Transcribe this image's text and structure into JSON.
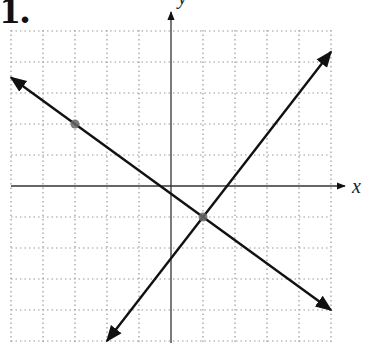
{
  "problem_label": "1.",
  "chart_data": {
    "type": "line",
    "title": "",
    "xlabel": "x",
    "ylabel": "y",
    "xlim": [
      -5,
      5
    ],
    "ylim": [
      -5,
      5
    ],
    "grid": true,
    "grid_style": "dotted",
    "series": [
      {
        "name": "line-1",
        "slope": -0.75,
        "intercept": -0.25,
        "x": [
          -5,
          5
        ],
        "y": [
          3.5,
          -4.0
        ],
        "arrows": "both"
      },
      {
        "name": "line-2",
        "slope": 1.333,
        "intercept": -2.333,
        "x": [
          -2,
          5
        ],
        "y": [
          -5.0,
          4.33
        ],
        "arrows": "both"
      }
    ],
    "points": [
      {
        "label": "marked point",
        "x": -3,
        "y": 2
      },
      {
        "label": "intersection",
        "x": 1,
        "y": -1
      }
    ]
  }
}
